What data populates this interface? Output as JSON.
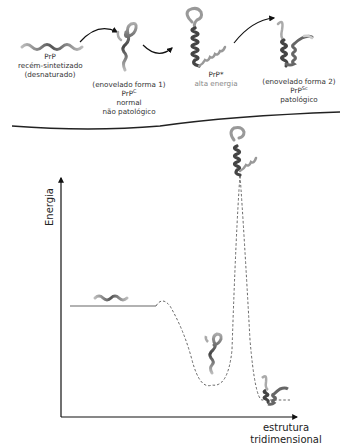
{
  "top_section": {
    "stage1": {
      "line1": "PrP",
      "line2": "recém-sintetizado",
      "line3": "(desnaturado)"
    },
    "stage2": {
      "line1": "(enovelado forma 1)",
      "prp": "PrP",
      "prp_sup": "C",
      "line3": "normal",
      "line4": "não patológico"
    },
    "stage3": {
      "prp": "PrP*",
      "line2": "alta energia"
    },
    "stage4": {
      "line1": "(enovelado forma 2)",
      "prp": "PrP",
      "prp_sup": "Sc",
      "line3": "patológico"
    }
  },
  "graph": {
    "y_axis_label": "Energia",
    "x_axis_label_line1": "estrutura",
    "x_axis_label_line2": "tridimensional"
  },
  "colors": {
    "line": "#222222",
    "protein_dark": "#555555",
    "protein_light": "#aaaaaa",
    "muted_text": "#888888"
  }
}
